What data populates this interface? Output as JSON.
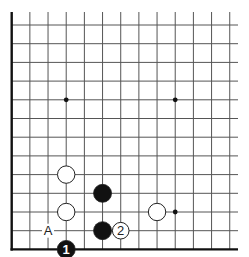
{
  "diagram": {
    "type": "go-board-diagram",
    "visible_columns": 13,
    "visible_rows": 13,
    "edges": [
      "left",
      "bottom"
    ],
    "colors": {
      "background": "#ffffff",
      "grid_line": "#555555",
      "edge_line": "#111111",
      "black_stone": "#111111",
      "white_stone": "#ffffff",
      "stone_outline": "#222222"
    },
    "star_points": [
      {
        "col": 3,
        "row": 4
      },
      {
        "col": 9,
        "row": 4
      },
      {
        "col": 9,
        "row": 10
      }
    ],
    "stones": [
      {
        "color": "white",
        "col": 3,
        "row": 8,
        "label": ""
      },
      {
        "color": "black",
        "col": 5,
        "row": 9,
        "label": ""
      },
      {
        "color": "white",
        "col": 3,
        "row": 10,
        "label": ""
      },
      {
        "color": "white",
        "col": 8,
        "row": 10,
        "label": ""
      },
      {
        "color": "black",
        "col": 5,
        "row": 11,
        "label": ""
      },
      {
        "color": "white",
        "col": 6,
        "row": 11,
        "label": "2"
      },
      {
        "color": "black",
        "col": 3,
        "row": 12,
        "label": "1"
      }
    ],
    "markers": [
      {
        "col": 2,
        "row": 11,
        "label": "A"
      }
    ]
  }
}
